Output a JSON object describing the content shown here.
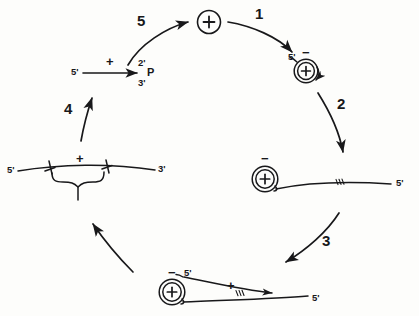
{
  "figure": {
    "type": "cycle-diagram",
    "title": "",
    "background_color": "#fdfdfb",
    "ink_color": "#18181a"
  },
  "steps": [
    {
      "id": "step-1",
      "label": "1",
      "x": 259,
      "y": 13
    },
    {
      "id": "step-2",
      "label": "2",
      "x": 339,
      "y": 103
    },
    {
      "id": "step-3",
      "label": "3",
      "x": 325,
      "y": 240
    },
    {
      "id": "step-4",
      "label": "4",
      "x": 67,
      "y": 108
    },
    {
      "id": "step-5",
      "label": "5",
      "x": 140,
      "y": 20
    }
  ],
  "nodes": {
    "top_circle": {
      "name": "free-circular-plus-strand",
      "charge": "+",
      "x": 209,
      "y": 22,
      "r": 12
    },
    "top_right": {
      "name": "circular-plus-strand-with-minus-template",
      "inner_charge": "+",
      "outer_charge": "−",
      "five_prime": "5'",
      "x": 306,
      "y": 70
    },
    "right_middle": {
      "name": "circular-complex-with-linear-minus-strand",
      "inner_charge": "+",
      "outer_charge": "−",
      "five_prime_end": "5'"
    },
    "bottom": {
      "name": "circular-complex-with-two-strands",
      "inner_charge": "+",
      "outer_charge": "−",
      "five_prime_upper": "5'",
      "five_prime_lower": "5'",
      "strand_charge": "+"
    },
    "left_middle": {
      "name": "linear-duplex-with-brace",
      "five_prime_end": "5'",
      "three_prime_end": "3'",
      "strand_charge": "+"
    },
    "top_left": {
      "name": "linear-plus-strand-with-cyclic-phosphate",
      "five_prime_end": "5'",
      "two_prime": "2'",
      "three_prime": "3'",
      "phosphate": "P",
      "strand_charge": "+"
    }
  }
}
